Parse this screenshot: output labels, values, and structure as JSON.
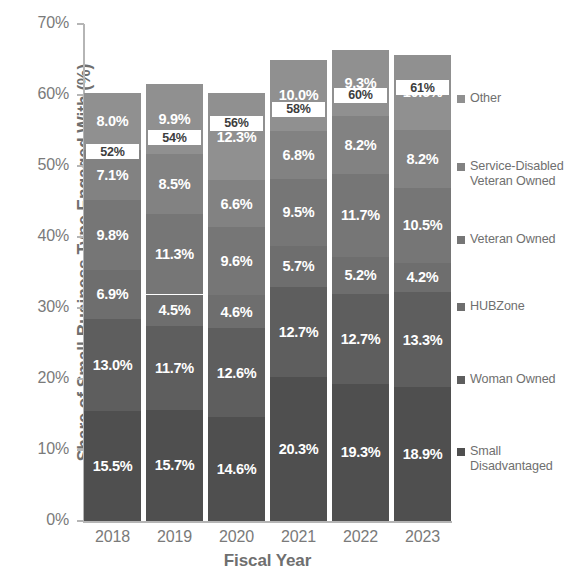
{
  "chart_data": {
    "type": "bar",
    "stacked": true,
    "title": "",
    "xlabel": "Fiscal Year",
    "ylabel": "Share of Small Business Type Engaged With (%)",
    "categories": [
      "2018",
      "2019",
      "2020",
      "2021",
      "2022",
      "2023"
    ],
    "ylim": [
      0,
      70
    ],
    "ytick_values": [
      0,
      10,
      20,
      30,
      40,
      50,
      60,
      70
    ],
    "ytick_labels": [
      "0%",
      "10%",
      "20%",
      "30%",
      "40%",
      "50%",
      "60%",
      "70%"
    ],
    "grid": false,
    "legend_position": "right",
    "series": [
      {
        "name": "Small Disadvantaged",
        "color": "#4f4f4f",
        "values": [
          15.5,
          15.7,
          14.6,
          20.3,
          19.3,
          18.9
        ],
        "labels": [
          "15.5%",
          "15.7%",
          "14.6%",
          "20.3%",
          "19.3%",
          "18.9%"
        ]
      },
      {
        "name": "Woman Owned",
        "color": "#5e5e5e",
        "values": [
          13.0,
          11.7,
          12.6,
          12.7,
          12.7,
          13.3
        ],
        "labels": [
          "13.0%",
          "11.7%",
          "12.6%",
          "12.7%",
          "12.7%",
          "13.3%"
        ]
      },
      {
        "name": "HUBZone",
        "color": "#6e6e6e",
        "values": [
          6.9,
          4.5,
          4.6,
          5.7,
          5.2,
          4.2
        ],
        "labels": [
          "6.9%",
          "4.5%",
          "4.6%",
          "5.7%",
          "5.2%",
          "4.2%"
        ]
      },
      {
        "name": "Veteran Owned",
        "color": "#767676",
        "values": [
          9.8,
          11.3,
          9.6,
          9.5,
          11.7,
          10.5
        ],
        "labels": [
          "9.8%",
          "11.3%",
          "9.6%",
          "9.5%",
          "11.7%",
          "10.5%"
        ]
      },
      {
        "name": "Service-Disabled\nVeteran Owned",
        "color": "#828282",
        "values": [
          7.1,
          8.5,
          6.6,
          6.8,
          8.2,
          8.2
        ],
        "labels": [
          "7.1%",
          "8.5%",
          "6.6%",
          "6.8%",
          "8.2%",
          "8.2%"
        ]
      },
      {
        "name": "Other",
        "color": "#909090",
        "values": [
          8.0,
          9.9,
          12.3,
          10.0,
          9.3,
          10.6
        ],
        "labels": [
          "8.0%",
          "9.9%",
          "12.3%",
          "10.0%",
          "9.3%",
          "10.6%"
        ]
      }
    ],
    "totals": [
      60.3,
      61.6,
      60.3,
      65.0,
      66.4,
      65.7
    ],
    "callouts": [
      {
        "category": "2018",
        "label": "52%",
        "value": 52
      },
      {
        "category": "2019",
        "label": "54%",
        "value": 54
      },
      {
        "category": "2020",
        "label": "56%",
        "value": 56
      },
      {
        "category": "2021",
        "label": "58%",
        "value": 58
      },
      {
        "category": "2022",
        "label": "60%",
        "value": 60
      },
      {
        "category": "2023",
        "label": "61%",
        "value": 61
      }
    ],
    "colors": {
      "axis": "#b5b5b5",
      "tick_text": "#7a7a7a",
      "axis_title": "#6f6f6f",
      "legend_text": "#6f6f6f",
      "bar_label_text": "#ffffff",
      "callout_bg": "#ffffff",
      "callout_text": "#3d3d3d",
      "background": "#ffffff"
    }
  },
  "legend": {
    "items": [
      {
        "label": "Other",
        "color": "#909090"
      },
      {
        "label": "Service-Disabled\nVeteran Owned",
        "color": "#828282"
      },
      {
        "label": "Veteran Owned",
        "color": "#767676"
      },
      {
        "label": "HUBZone",
        "color": "#6e6e6e"
      },
      {
        "label": "Woman Owned",
        "color": "#5e5e5e"
      },
      {
        "label": "Small\nDisadvantaged",
        "color": "#4f4f4f"
      }
    ]
  }
}
